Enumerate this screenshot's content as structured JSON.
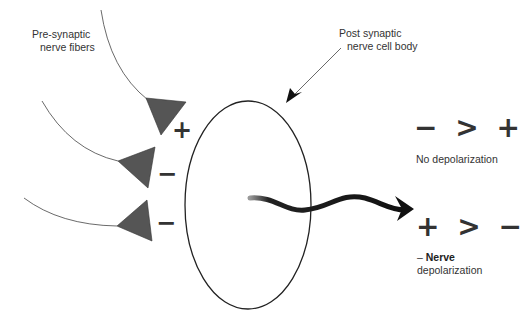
{
  "labels": {
    "pre_synaptic_line1": "Pre-synaptic",
    "pre_synaptic_line2": "nerve fibers",
    "post_synaptic_line1": "Post synaptic",
    "post_synaptic_line2": "nerve cell body"
  },
  "synapse_signs": [
    "+",
    "−",
    "−"
  ],
  "outcomes": [
    {
      "expression": "− > +",
      "caption_prefix": "",
      "caption_bold": "",
      "caption": "No depolarization"
    },
    {
      "expression": "+ > −",
      "caption_prefix": "– ",
      "caption_bold": "Nerve",
      "caption": "depolarization"
    }
  ],
  "colors": {
    "terminal_fill": "#555555",
    "line": "#333333",
    "arrow": "#111111"
  }
}
